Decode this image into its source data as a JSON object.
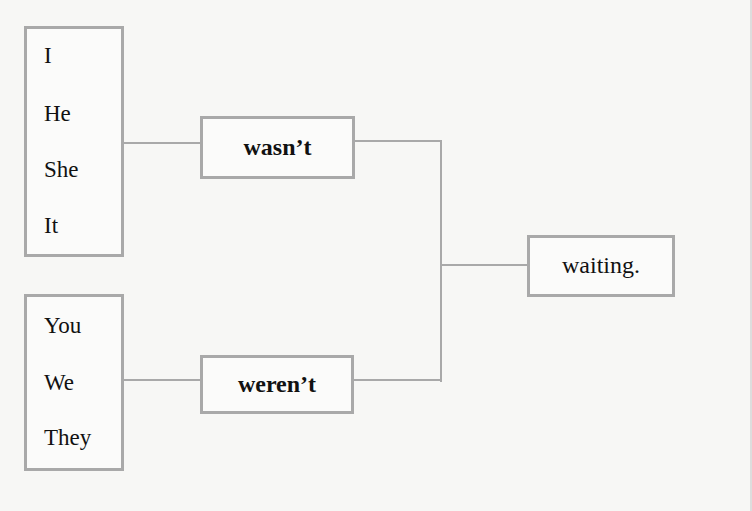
{
  "diagram": {
    "group1": {
      "pronouns": [
        "I",
        "He",
        "She",
        "It"
      ]
    },
    "group2": {
      "pronouns": [
        "You",
        "We",
        "They"
      ]
    },
    "verb1": "wasn’t",
    "verb2": "weren’t",
    "ending": "waiting.",
    "colors": {
      "border": "#a9a9a9",
      "text": "#111111",
      "background": "#f7f7f5"
    }
  }
}
